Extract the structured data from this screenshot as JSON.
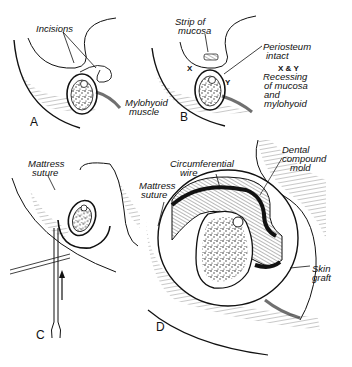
{
  "figure": {
    "panels": [
      {
        "id": "A",
        "letter": "A",
        "labels": {
          "incisions": "Incisions",
          "mylohyoid1": "Mylohyoid",
          "mylohyoid2": "muscle"
        }
      },
      {
        "id": "B",
        "letter": "B",
        "labels": {
          "strip1": "Strip of",
          "strip2": "mucosa",
          "peri1": "Periosteum",
          "peri2": "intact",
          "x": "X",
          "y": "Y",
          "xy": "X & Y",
          "rec1": "Recessing",
          "rec2": "of mucosa",
          "rec3": "and",
          "rec4": "mylohyoid"
        }
      },
      {
        "id": "C",
        "letter": "C",
        "labels": {
          "mattress1": "Mattress",
          "mattress2": "suture"
        }
      },
      {
        "id": "D",
        "letter": "D",
        "labels": {
          "circ1": "Circumferential",
          "circ2": "wire",
          "mattress1": "Mattress",
          "mattress2": "suture",
          "dental1": "Dental",
          "dental2": "compound",
          "dental3": "mold",
          "skin1": "Skin",
          "skin2": "graft"
        }
      }
    ],
    "colors": {
      "ink": "#111111",
      "background": "#ffffff"
    }
  }
}
